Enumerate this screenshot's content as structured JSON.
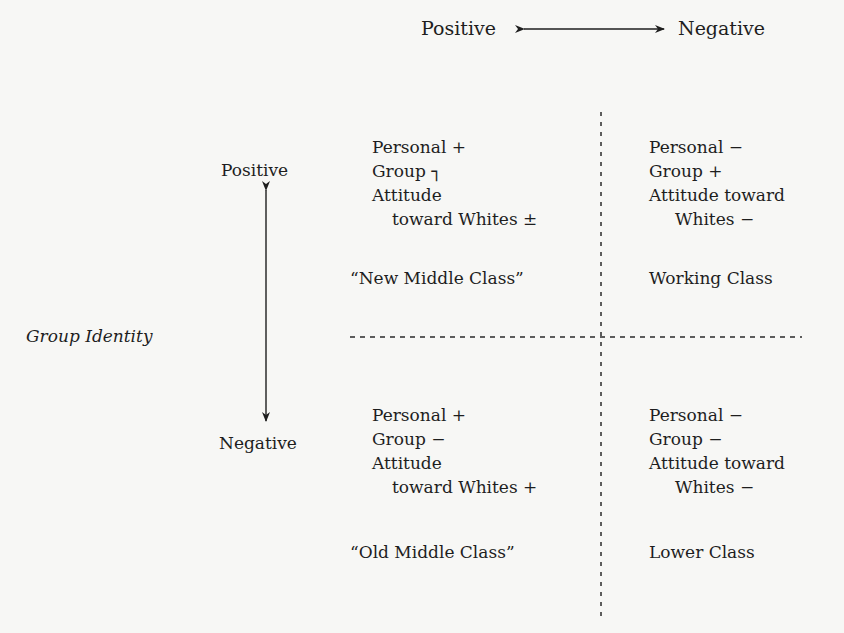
{
  "diagram": {
    "horizontal_axis": {
      "left_label": "Positive",
      "right_label": "Negative"
    },
    "vertical_axis": {
      "title": "Group Identity",
      "top_label": "Positive",
      "bottom_label": "Negative"
    },
    "quadrants": {
      "top_left": {
        "lines": [
          "Personal +",
          "Group ┐",
          "Attitude",
          "toward Whites ±"
        ],
        "class_label": "“New Middle Class”"
      },
      "top_right": {
        "lines": [
          "Personal −",
          "Group +",
          "Attitude toward",
          "Whites −"
        ],
        "class_label": "Working Class"
      },
      "bottom_left": {
        "lines": [
          "Personal +",
          "Group −",
          "Attitude",
          "toward Whites +"
        ],
        "class_label": "“Old Middle Class”"
      },
      "bottom_right": {
        "lines": [
          "Personal −",
          "Group −",
          "Attitude toward",
          "Whites −"
        ],
        "class_label": "Lower Class"
      }
    },
    "icons": {
      "horizontal_arrow": "double-headed-arrow-horizontal",
      "vertical_arrow": "double-headed-arrow-vertical"
    }
  }
}
